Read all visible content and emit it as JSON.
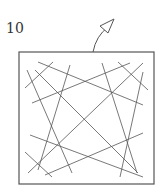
{
  "figure": {
    "reference_numeral": "10",
    "stroke_color": "#555555",
    "frame": {
      "x": 19,
      "y": 52,
      "width": 135,
      "height": 132
    },
    "leader_arrow": {
      "path": "M93 52 Q96 36 108 27",
      "head": "100,26 114,19 108,33"
    },
    "lines": [
      {
        "x1": 38,
        "y1": 62,
        "x2": 143,
        "y2": 105
      },
      {
        "x1": 53,
        "y1": 62,
        "x2": 25,
        "y2": 88
      },
      {
        "x1": 35,
        "y1": 70,
        "x2": 138,
        "y2": 173
      },
      {
        "x1": 27,
        "y1": 70,
        "x2": 72,
        "y2": 173
      },
      {
        "x1": 70,
        "y1": 65,
        "x2": 38,
        "y2": 170
      },
      {
        "x1": 32,
        "y1": 103,
        "x2": 130,
        "y2": 63
      },
      {
        "x1": 118,
        "y1": 62,
        "x2": 148,
        "y2": 90
      },
      {
        "x1": 143,
        "y1": 63,
        "x2": 28,
        "y2": 173
      },
      {
        "x1": 102,
        "y1": 63,
        "x2": 137,
        "y2": 173
      },
      {
        "x1": 143,
        "y1": 72,
        "x2": 120,
        "y2": 177
      },
      {
        "x1": 30,
        "y1": 135,
        "x2": 143,
        "y2": 177
      },
      {
        "x1": 25,
        "y1": 152,
        "x2": 52,
        "y2": 177
      },
      {
        "x1": 45,
        "y1": 175,
        "x2": 143,
        "y2": 133
      }
    ]
  }
}
